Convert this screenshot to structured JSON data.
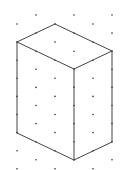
{
  "diagram": {
    "type": "isometric-dot-grid-prism",
    "grid": {
      "columns_x": [
        17,
        36,
        55,
        74,
        93,
        112
      ],
      "column_offsets_y": [
        24,
        15,
        24,
        15,
        24,
        15
      ],
      "row_spacing": 18.1,
      "rows": 9,
      "dot_color": "#333333",
      "dot_radius": 0.8
    },
    "prism": {
      "edge_color": "#444444",
      "edge_width": 1,
      "vertices": {
        "top_back": [
          55,
          24
        ],
        "top_left": [
          17,
          42
        ],
        "top_right": [
          112,
          51
        ],
        "top_front": [
          74,
          69
        ],
        "bottom_left": [
          17,
          133
        ],
        "bottom_right": [
          112,
          142
        ],
        "bottom_front": [
          74,
          160
        ]
      },
      "edges": [
        [
          "top_back",
          "top_left"
        ],
        [
          "top_back",
          "top_right"
        ],
        [
          "top_left",
          "top_front"
        ],
        [
          "top_right",
          "top_front"
        ],
        [
          "top_left",
          "bottom_left"
        ],
        [
          "top_front",
          "bottom_front"
        ],
        [
          "top_right",
          "bottom_right"
        ],
        [
          "bottom_left",
          "bottom_front"
        ],
        [
          "bottom_right",
          "bottom_front"
        ]
      ]
    }
  }
}
